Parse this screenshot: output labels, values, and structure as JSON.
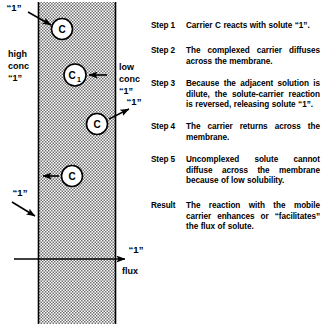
{
  "diagram": {
    "membrane_label": "membrane",
    "fill_pattern": "stipple-dots",
    "colors": {
      "ink": "#000000",
      "membrane_fill": "#d8d8d8",
      "background": "#ffffff"
    },
    "left_side": {
      "conc_line1": "high",
      "conc_line2": "conc",
      "conc_line3": "“1”"
    },
    "right_side": {
      "conc_line1": "low",
      "conc_line2": "conc",
      "conc_line3": "“1”"
    },
    "carriers": [
      {
        "id": "carrier-top",
        "label": "C",
        "sub": ""
      },
      {
        "id": "carrier-complex",
        "label": "C",
        "sub": "1"
      },
      {
        "id": "carrier-release",
        "label": "C",
        "sub": ""
      },
      {
        "id": "carrier-return",
        "label": "C",
        "sub": ""
      }
    ],
    "solute_labels": {
      "top_left": "“1”",
      "mid_right": "“1”",
      "lower_left": "“1”",
      "flux_solute": "“1”"
    },
    "flux_label": "flux"
  },
  "steps": [
    {
      "label": "Step 1",
      "text": "Carrier C reacts with solute “1”."
    },
    {
      "label": "Step 2",
      "text": "The complexed carrier diffuses across the membrane."
    },
    {
      "label": "Step 3",
      "text": "Because the adjacent solution is dilute, the solute-carrier reaction is reversed, releasing solute “1”."
    },
    {
      "label": "Step 4",
      "text": "The carrier returns across the membrane."
    },
    {
      "label": "Step 5",
      "text": "Uncomplexed solute cannot diffuse across the membrane because of low solubility."
    },
    {
      "label": "Result",
      "text": "The reaction with the mobile carrier enhances or “facilitates” the flux of solute."
    }
  ]
}
